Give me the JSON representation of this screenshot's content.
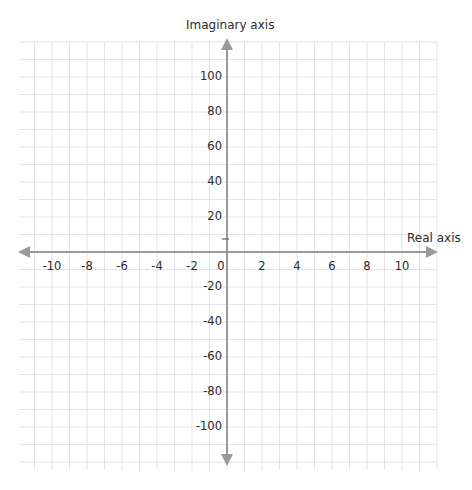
{
  "chart_data": {
    "type": "scatter",
    "title": "",
    "subtitle": "Complex plane (Argand diagram)",
    "xlabel": "Real axis",
    "ylabel": "Imaginary axis",
    "xlim": [
      -11.5,
      11.5
    ],
    "ylim": [
      -120,
      120
    ],
    "x_ticks": [
      -10,
      -8,
      -6,
      -4,
      -2,
      0,
      2,
      4,
      6,
      8,
      10
    ],
    "x_tick_labels": [
      "-10",
      "-8",
      "-6",
      "-4",
      "-2",
      "0",
      "2",
      "4",
      "6",
      "8",
      "10"
    ],
    "y_ticks": [
      100,
      80,
      60,
      40,
      20,
      -20,
      -40,
      -60,
      -80,
      -100
    ],
    "y_tick_labels": [
      "100",
      "80",
      "60",
      "40",
      "20",
      "-20",
      "-40",
      "-60",
      "-80",
      "-100"
    ],
    "grid": true,
    "grid_minor_step_x": 1,
    "grid_minor_step_y": 10,
    "legend": null,
    "series": [],
    "annotations": [
      {
        "type": "tick-mark",
        "x": 0,
        "y": 8
      }
    ]
  },
  "colors": {
    "axis": "#9a9a9a",
    "grid": "#e3e3e3",
    "text": "#2a2a2a"
  },
  "axes": {
    "real_label": "Real axis",
    "imag_label": "Imaginary axis"
  }
}
